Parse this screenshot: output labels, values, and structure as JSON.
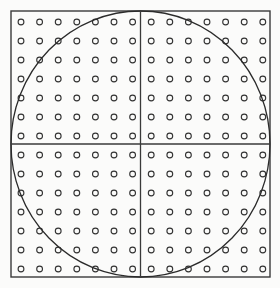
{
  "figure": {
    "canvas": {
      "width": 280,
      "height": 288
    },
    "background_color": "#fbfbfa",
    "ink_color": "#2b2b2b",
    "frame": {
      "name": "outer-square",
      "x": 11,
      "y": 11,
      "width": 259,
      "height": 266,
      "stroke_width": 1.4,
      "stroke_color": "#3a3a3a",
      "fill": "none"
    },
    "circle": {
      "name": "inscribed-circle",
      "center_x": 140.5,
      "center_y": 144,
      "radius_x": 129.5,
      "radius_y": 133,
      "stroke_width": 1.3,
      "stroke_color": "#2b2b2b",
      "fill": "none",
      "tangent_points": [
        "top-center",
        "right-middle",
        "bottom-center",
        "left-middle"
      ]
    },
    "crosshair": {
      "name": "center-crosshair",
      "vertical_x": 140.5,
      "horizontal_y": 144,
      "stroke_width": 1.3,
      "stroke_color": "#3a3a3a",
      "quadrant_count": 4
    },
    "grid": {
      "name": "dot-grid",
      "columns": 14,
      "rows": 14,
      "total_dots": 196,
      "first_x": 21,
      "first_y": 22,
      "step_x": 18.6,
      "step_y": 19.0,
      "marker": {
        "shape": "ring",
        "radius": 2.9,
        "stroke_width": 1.1,
        "stroke_color": "#333333",
        "fill": "none"
      }
    },
    "labels": []
  }
}
